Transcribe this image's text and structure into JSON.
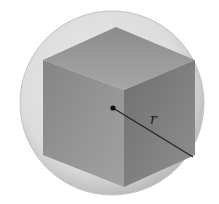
{
  "figure": {
    "radius_label": "r",
    "colors": {
      "background": "#ffffff",
      "sphere_edge": "#bdbdbd",
      "sphere_inner": "#e9e9e9",
      "cube_top": "#9a9a9a",
      "cube_left": "#8e8e8e",
      "cube_right": "#7b7b7b",
      "radius_line": "#222222"
    },
    "geometry": {
      "sphere_center": [
        112,
        103
      ],
      "sphere_radius": 92,
      "cube_vertices": {
        "top": [
          116,
          27
        ],
        "top_left": [
          43,
          60
        ],
        "top_right": [
          195,
          60
        ],
        "front_top": [
          124,
          90
        ],
        "bottom_left": [
          43,
          155
        ],
        "front_bottom": [
          124,
          187
        ],
        "bottom_right": [
          195,
          155
        ]
      },
      "center_point": [
        113,
        108
      ],
      "radius_end": [
        193,
        157
      ]
    }
  }
}
